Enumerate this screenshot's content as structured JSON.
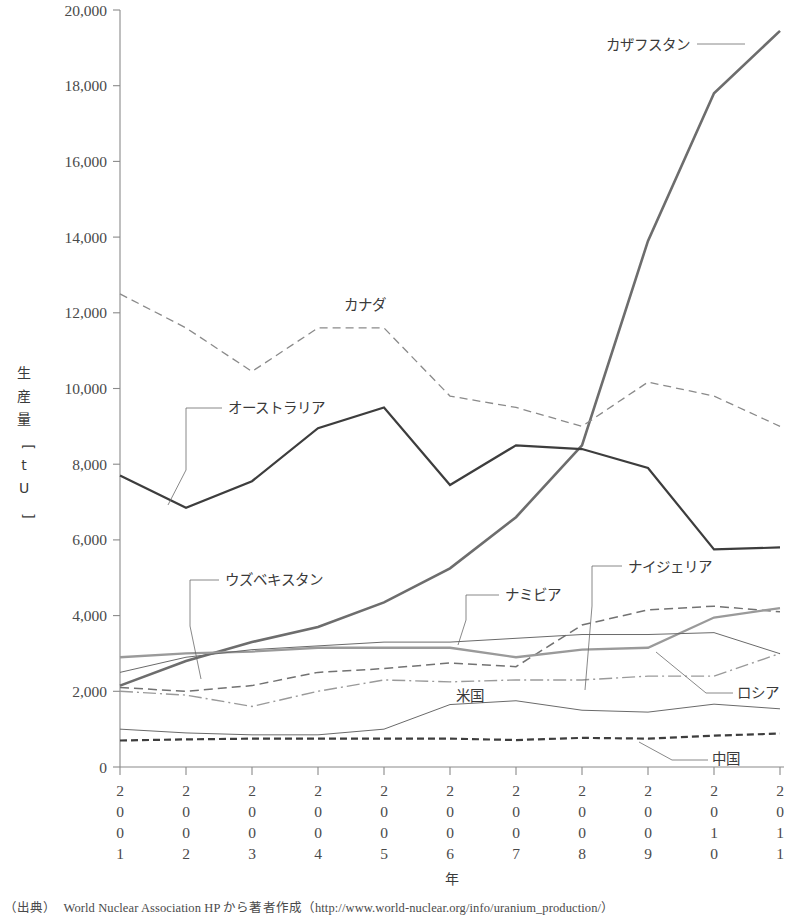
{
  "figure": {
    "source_note": "（出典）　World Nuclear Association HP から著者作成（http://www.world-nuclear.org/info/uranium_production/）"
  },
  "chart_data": {
    "type": "line",
    "title": "",
    "xlabel": "年",
    "ylabel": "生産量[tU]",
    "ylabel_chars": [
      "生",
      "産",
      "量",
      "[",
      "t",
      "U",
      "]"
    ],
    "categories": [
      "2001",
      "2002",
      "2003",
      "2004",
      "2005",
      "2006",
      "2007",
      "2008",
      "2009",
      "2010",
      "2011"
    ],
    "ylim": [
      0,
      20000
    ],
    "yticks": [
      0,
      2000,
      4000,
      6000,
      8000,
      10000,
      12000,
      14000,
      16000,
      18000,
      20000
    ],
    "ytick_labels": [
      "0",
      "2,000",
      "4,000",
      "6,000",
      "8,000",
      "10,000",
      "12,000",
      "14,000",
      "16,000",
      "18,000",
      "20,000"
    ],
    "grid": false,
    "legend": "inline-annotations",
    "series": [
      {
        "name": "カザフスタン",
        "key": "kazakhstan",
        "color": "#6d6d6d",
        "width": 2.6,
        "dash": "none",
        "values": [
          2150,
          2800,
          3300,
          3700,
          4350,
          5250,
          6600,
          8500,
          13900,
          17800,
          19450
        ],
        "label_x": 690,
        "label_y": 50,
        "label_anchor": "end"
      },
      {
        "name": "カナダ",
        "key": "canada",
        "color": "#8a8a8a",
        "width": 1.3,
        "dash": "8,5",
        "values": [
          12500,
          11600,
          10450,
          11600,
          11600,
          9800,
          9500,
          9000,
          10170,
          9800,
          9000
        ],
        "label_x": 344,
        "label_y": 310,
        "label_anchor": "start"
      },
      {
        "name": "オーストラリア",
        "key": "australia",
        "color": "#3d3d3d",
        "width": 2.2,
        "dash": "none",
        "values": [
          7700,
          6850,
          7550,
          8950,
          9500,
          7450,
          8500,
          8400,
          7900,
          5750,
          5800
        ],
        "label_x": 228,
        "label_y": 413,
        "label_anchor": "start"
      },
      {
        "name": "ナイジェリア",
        "key": "niger",
        "color": "#727272",
        "width": 1.5,
        "dash": "9,5",
        "values": [
          2100,
          2000,
          2150,
          2500,
          2600,
          2750,
          2650,
          3750,
          4150,
          4250,
          4100
        ],
        "label_x": 628,
        "label_y": 572,
        "label_anchor": "start"
      },
      {
        "name": "ナミビア",
        "key": "namibia",
        "color": "#9a9a9a",
        "width": 2.3,
        "dash": "none",
        "values": [
          2900,
          3000,
          3050,
          3150,
          3150,
          3150,
          2900,
          3100,
          3150,
          3950,
          4200
        ],
        "label_x": 505,
        "label_y": 600,
        "label_anchor": "start"
      },
      {
        "name": "ウズベキスタン",
        "key": "uzbekistan",
        "color": "#9a9a9a",
        "width": 1.4,
        "dash": "13,4,2,4",
        "values": [
          2000,
          1900,
          1600,
          2000,
          2300,
          2250,
          2300,
          2300,
          2400,
          2400,
          3000
        ],
        "label_x": 225,
        "label_y": 585,
        "label_anchor": "start"
      },
      {
        "name": "ロシア",
        "key": "russia",
        "color": "#6a6a6a",
        "width": 1.0,
        "dash": "none",
        "values": [
          2500,
          2900,
          3100,
          3200,
          3300,
          3300,
          3400,
          3500,
          3500,
          3550,
          2993
        ],
        "label_x": 737,
        "label_y": 698,
        "label_anchor": "start"
      },
      {
        "name": "米国",
        "key": "usa",
        "color": "#6a6a6a",
        "width": 1.0,
        "dash": "none",
        "values": [
          1000,
          900,
          850,
          850,
          1000,
          1650,
          1750,
          1500,
          1450,
          1660,
          1537
        ],
        "label_x": 456,
        "label_y": 701,
        "label_anchor": "start"
      },
      {
        "name": "中国",
        "key": "china",
        "color": "#3d3d3d",
        "width": 2.2,
        "dash": "7,4",
        "values": [
          700,
          730,
          750,
          750,
          750,
          750,
          712,
          769,
          750,
          827,
          885
        ],
        "label_x": 712,
        "label_y": 764,
        "label_anchor": "start"
      }
    ]
  }
}
